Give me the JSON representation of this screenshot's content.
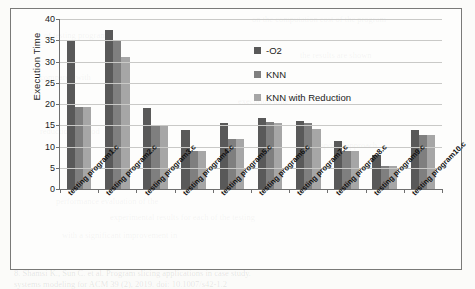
{
  "chart_data": {
    "type": "bar",
    "title": "",
    "xlabel": "",
    "ylabel": "Execution Time",
    "ylim": [
      0,
      40
    ],
    "ytick_step": 5,
    "yticks": [
      0,
      5,
      10,
      15,
      20,
      25,
      30,
      35,
      40
    ],
    "grid": true,
    "legend_position": "upper-right-inside",
    "categories": [
      "testing program1.c",
      "testing program2.c",
      "testing program3.c",
      "testing program4.c",
      "testing program5.c",
      "testing program6.c",
      "testing program7.c",
      "testing program8.c",
      "testing program9.c",
      "testing program10.c"
    ],
    "series": [
      {
        "name": "-O2",
        "color": "#595959",
        "values": [
          35.0,
          37.5,
          19.0,
          13.8,
          15.5,
          16.7,
          16.1,
          11.2,
          8.0,
          14.0
        ]
      },
      {
        "name": "KNN",
        "color": "#7f7f7f",
        "values": [
          19.2,
          35.0,
          14.9,
          9.0,
          11.7,
          15.8,
          15.6,
          8.9,
          5.3,
          12.7
        ]
      },
      {
        "name": "KNN with Reduction",
        "color": "#a6a6a6",
        "values": [
          19.2,
          31.0,
          14.9,
          9.0,
          11.7,
          15.5,
          14.2,
          8.9,
          5.3,
          12.6
        ]
      }
    ]
  },
  "background_text": [
    {
      "text": "on the computation cost of the program",
      "x": 252,
      "y": 14
    },
    {
      "text": "of testing programs",
      "x": 44,
      "y": 30
    },
    {
      "text": "the results are shown",
      "x": 300,
      "y": 50
    },
    {
      "text": "compared with",
      "x": 40,
      "y": 72
    },
    {
      "text": "execution time",
      "x": 238,
      "y": 96
    },
    {
      "text": "reduction method",
      "x": 40,
      "y": 126
    },
    {
      "text": "the proposed approach",
      "x": 300,
      "y": 140
    },
    {
      "text": "performance evaluation of the",
      "x": 56,
      "y": 196
    },
    {
      "text": "experimental results for each of the testing",
      "x": 110,
      "y": 212
    },
    {
      "text": "with a significant improvement in",
      "x": 62,
      "y": 230
    },
    {
      "text": "8. Shamsi K., Sun C. et al. Program slicing applications in case study.",
      "x": 14,
      "y": 268
    },
    {
      "text": "systems modeling for ACM 39 (2), 2019. doi: 10.1007/s42-1.2",
      "x": 14,
      "y": 279
    }
  ]
}
